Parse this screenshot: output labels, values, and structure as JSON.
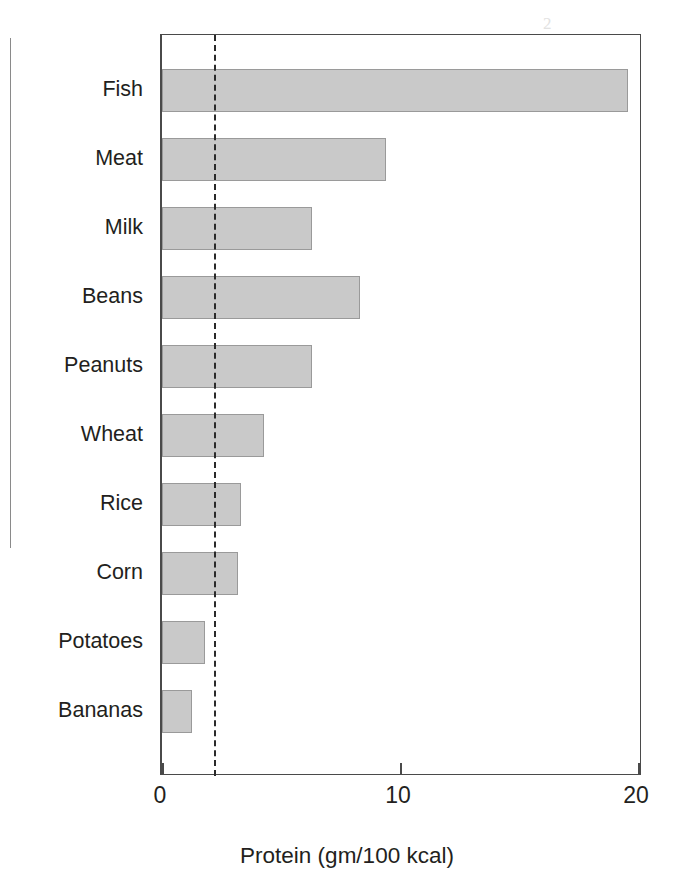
{
  "chart_data": {
    "type": "bar",
    "orientation": "horizontal",
    "title": "",
    "xlabel": "Protein (gm/100 kcal)",
    "ylabel": "",
    "categories": [
      "Fish",
      "Meat",
      "Milk",
      "Beans",
      "Peanuts",
      "Wheat",
      "Rice",
      "Corn",
      "Potatoes",
      "Bananas"
    ],
    "values": [
      19.6,
      9.4,
      6.3,
      8.3,
      6.3,
      4.3,
      3.3,
      3.2,
      1.8,
      1.25
    ],
    "xlim": [
      0,
      20
    ],
    "xticks": [
      0,
      10,
      20
    ],
    "xtick_labels": [
      "0",
      "10",
      "20"
    ],
    "grid": false,
    "legend": null,
    "annotations": [
      {
        "name": "protein-requirement-reference-line",
        "style": "dashed-vertical",
        "value": 2.2,
        "label": ""
      }
    ],
    "colors": {
      "bar_fill": "#c9c9c9",
      "bar_border": "#9a9a9a",
      "axis": "#4a4a4a",
      "reference_line": "#2a2a2a",
      "text": "#231f20"
    }
  },
  "figure": {
    "scan_artifact": "2"
  }
}
